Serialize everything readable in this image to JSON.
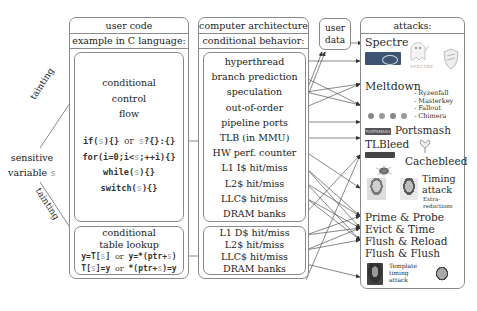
{
  "left": {
    "sensitive_label_1": "sensitive",
    "sensitive_label_2": "variable s",
    "tainting_top": "tainting",
    "tainting_bottom": "tainting"
  },
  "user_code": {
    "title": "user code",
    "subtitle": "example in C language:",
    "control_flow": {
      "heading": [
        "conditional",
        "control",
        "flow"
      ],
      "code": [
        "if(s){} or s?{}:{}",
        "for(i=0;i<s;++i){}",
        "while(s){}",
        "switch(s){}"
      ]
    },
    "table_lookup": {
      "heading": [
        "conditional",
        "table lookup"
      ],
      "code": [
        "y=T[s] or y=*(ptr+s)",
        "T[s]=y or *(ptr+s)=y"
      ]
    }
  },
  "architecture": {
    "title": "computer architecture",
    "subtitle": "conditional behavior:",
    "control_items": [
      "hyperthread",
      "branch prediction",
      "speculation",
      "out-of-order",
      "pipeline ports",
      "TLB (in MMU)",
      "HW perf. counter",
      "L1 I$ hit/miss",
      "L2$ hit/miss",
      "LLC$ hit/miss",
      "DRAM banks"
    ],
    "data_items": [
      "L1 D$ hit/miss",
      "L2$ hit/miss",
      "LLC$ hit/miss",
      "DRAM banks"
    ]
  },
  "user_data": {
    "label_1": "user",
    "label_2": "data"
  },
  "attacks": {
    "title": "attacks:",
    "spectre": "Spectre",
    "spectre_logo_text": "SPECTRE",
    "meltdown": "Meltdown",
    "amd_variants": [
      "- Ryzenfall",
      "- Masterkey",
      "- Fallout",
      "- Chimera"
    ],
    "portsmash_logo_text": "PORTSMASH",
    "portsmash": "Portsmash",
    "tlbleed": "TLBleed",
    "cachebleed": "Cachebleed",
    "timing_1": "Timing",
    "timing_2": "attack",
    "extra_1": "Extra-",
    "extra_2": "reductions",
    "cache_attacks": [
      "Prime & Probe",
      "Evict & Time",
      "Flush & Reload",
      "Flush & Flush"
    ],
    "template_1": "Template",
    "template_2": "timing",
    "template_3": "attack"
  },
  "colors": {
    "border": "#8a8a8a",
    "arrow": "#333333",
    "variable": "#999999"
  }
}
